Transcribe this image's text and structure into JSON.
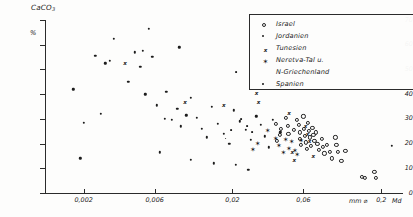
{
  "chart_data": {
    "type": "scatter",
    "title": "",
    "ylabel": "CaCO",
    "ylabel_sub": "3",
    "yunit": "%",
    "xlabel": "",
    "xunit": "mm ⌀",
    "xsecondary": "Md",
    "ylim": [
      0,
      70
    ],
    "yticks": [
      0,
      10,
      20,
      30,
      40,
      50,
      60,
      70
    ],
    "xscale": "log",
    "xlim": [
      0.0011,
      0.28
    ],
    "xticks": [
      0.002,
      0.006,
      0.02,
      0.06,
      0.2
    ],
    "xticklabels": [
      "0,002",
      "0,006",
      "0,02",
      "0,06",
      "0,2"
    ],
    "grid": false,
    "legend_position": "top-right",
    "series": [
      {
        "name": "Israel",
        "marker": "open-circle",
        "points": [
          [
            0.0455,
            30.5
          ],
          [
            0.047,
            27.0
          ],
          [
            0.0475,
            24.0
          ],
          [
            0.052,
            25.5
          ],
          [
            0.0545,
            29.5
          ],
          [
            0.056,
            27.5
          ],
          [
            0.0565,
            24.5
          ],
          [
            0.057,
            22.0
          ],
          [
            0.0575,
            19.5
          ],
          [
            0.06,
            31.0
          ],
          [
            0.0605,
            26.0
          ],
          [
            0.0615,
            23.0
          ],
          [
            0.062,
            20.5
          ],
          [
            0.063,
            18.0
          ],
          [
            0.0645,
            28.5
          ],
          [
            0.0655,
            25.0
          ],
          [
            0.066,
            22.5
          ],
          [
            0.067,
            19.0
          ],
          [
            0.069,
            26.5
          ],
          [
            0.07,
            23.5
          ],
          [
            0.071,
            21.0
          ],
          [
            0.073,
            24.5
          ],
          [
            0.0745,
            20.0
          ],
          [
            0.076,
            17.5
          ],
          [
            0.0795,
            22.0
          ],
          [
            0.081,
            18.5
          ],
          [
            0.083,
            16.0
          ],
          [
            0.0865,
            19.5
          ],
          [
            0.09,
            16.5
          ],
          [
            0.0935,
            14.0
          ],
          [
            0.0985,
            22.5
          ],
          [
            0.1,
            19.5
          ],
          [
            0.102,
            16.5
          ],
          [
            0.108,
            13.0
          ],
          [
            0.115,
            17.0
          ],
          [
            0.148,
            6.5
          ],
          [
            0.156,
            6.0
          ],
          [
            0.18,
            8.5
          ],
          [
            0.184,
            6.0
          ],
          [
            0.0425,
            26.0
          ],
          [
            0.0415,
            23.5
          ],
          [
            0.04,
            21.0
          ],
          [
            0.039,
            28.0
          ]
        ]
      },
      {
        "name": "Jordanien",
        "marker": "dot",
        "points": [
          [
            0.0017,
            42.0
          ],
          [
            0.0019,
            14.0
          ],
          [
            0.0024,
            55.5
          ],
          [
            0.0026,
            32.0
          ],
          [
            0.0028,
            52.5
          ],
          [
            0.003,
            53.5
          ],
          [
            0.0032,
            62.5
          ],
          [
            0.004,
            45.0
          ],
          [
            0.0044,
            57.0
          ],
          [
            0.0048,
            51.0
          ],
          [
            0.005,
            57.5
          ],
          [
            0.0052,
            40.0
          ],
          [
            0.0055,
            66.5
          ],
          [
            0.0058,
            55.0
          ],
          [
            0.0062,
            35.5
          ],
          [
            0.007,
            30.0
          ],
          [
            0.0078,
            29.5
          ],
          [
            0.0085,
            34.0
          ],
          [
            0.009,
            27.0
          ],
          [
            0.0098,
            31.5
          ],
          [
            0.0105,
            38.5
          ],
          [
            0.0115,
            30.5
          ],
          [
            0.0125,
            26.0
          ],
          [
            0.0135,
            22.5
          ],
          [
            0.0145,
            35.0
          ],
          [
            0.016,
            28.0
          ],
          [
            0.0175,
            24.0
          ],
          [
            0.019,
            20.0
          ],
          [
            0.0205,
            33.5
          ],
          [
            0.0225,
            29.0
          ],
          [
            0.0245,
            25.5
          ],
          [
            0.0265,
            21.5
          ],
          [
            0.029,
            31.0
          ],
          [
            0.031,
            27.5
          ],
          [
            0.033,
            23.0
          ],
          [
            0.035,
            18.5
          ],
          [
            0.0375,
            29.5
          ],
          [
            0.042,
            24.5
          ],
          [
            0.0105,
            13.5
          ],
          [
            0.015,
            12.0
          ],
          [
            0.021,
            11.5
          ],
          [
            0.0255,
            9.5
          ],
          [
            0.0065,
            16.5
          ],
          [
            0.0072,
            41.0
          ],
          [
            0.0088,
            59.0
          ],
          [
            0.235,
            19.0
          ],
          [
            0.002,
            28.5
          ]
        ]
      },
      {
        "name": "Tunesien",
        "marker": "x",
        "points": [
          [
            0.0038,
            52.5
          ],
          [
            0.0096,
            37.0
          ],
          [
            0.0175,
            35.5
          ],
          [
            0.029,
            40.5
          ],
          [
            0.03,
            37.0
          ],
          [
            0.048,
            32.5
          ],
          [
            0.0505,
            16.5
          ],
          [
            0.052,
            13.5
          ],
          [
            0.062,
            27.0
          ],
          [
            0.064,
            24.0
          ],
          [
            0.066,
            21.0
          ],
          [
            0.07,
            15.0
          ]
        ]
      },
      {
        "name": "Neretva-Tal u. N-Griechenland",
        "marker": "star",
        "points": [
          [
            0.0345,
            25.0
          ],
          [
            0.039,
            22.0
          ],
          [
            0.041,
            19.0
          ],
          [
            0.0455,
            21.5
          ],
          [
            0.048,
            18.0
          ],
          [
            0.05,
            20.5
          ],
          [
            0.0525,
            17.0
          ],
          [
            0.0545,
            15.5
          ],
          [
            0.0295,
            20.0
          ],
          [
            0.0275,
            17.5
          ],
          [
            0.044,
            16.0
          ],
          [
            0.058,
            21.0
          ]
        ]
      },
      {
        "name": "Spanien",
        "marker": "small-dot",
        "points": [
          [
            0.0212,
            49.0
          ],
          [
            0.023,
            30.0
          ],
          [
            0.025,
            27.0
          ],
          [
            0.027,
            24.5
          ],
          [
            0.0195,
            25.5
          ],
          [
            0.018,
            22.0
          ]
        ]
      }
    ]
  },
  "axes": {
    "y_title": "CaCO",
    "y_title_sub": "3",
    "y_unit": "%",
    "y_ticks": [
      "70",
      "60",
      "50",
      "40",
      "30",
      "20",
      "10",
      "0"
    ],
    "x_ticks": [
      "0,002",
      "0,006",
      "0,02",
      "0,06",
      "0,2"
    ],
    "x_unit": "mm ⌀",
    "x_md": "Md"
  },
  "legend": {
    "items": [
      {
        "label": "Israel",
        "marker": "open-circle"
      },
      {
        "label": "Jordanien",
        "marker": "dot"
      },
      {
        "label": "Tunesien",
        "marker": "x"
      },
      {
        "label": "Neretva-Tal u.",
        "marker": "star"
      },
      {
        "label": "N-Griechenland",
        "marker": "none"
      },
      {
        "label": "Spanien",
        "marker": "small-dot"
      }
    ]
  },
  "colors": {
    "ink": "#1c1c1c",
    "axis": "#2b2b2b",
    "background": "#fdfdfc"
  }
}
